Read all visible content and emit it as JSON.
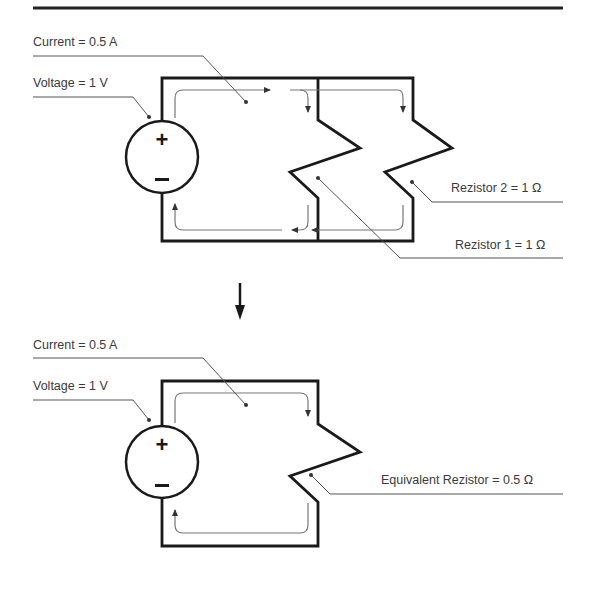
{
  "diagram": {
    "top_circuit": {
      "current_label": "Current = 0.5 A",
      "voltage_label": "Voltage = 1 V",
      "resistor2_label": "Rezistor  2 = 1 Ω",
      "resistor1_label": "Rezistor 1 = 1 Ω",
      "source_plus": "+",
      "source_minus": "–"
    },
    "bottom_circuit": {
      "current_label": "Current = 0.5 A",
      "voltage_label": "Voltage = 1 V",
      "equivalent_label": "Equivalent Rezistor = 0.5 Ω",
      "source_plus": "+",
      "source_minus": "–"
    },
    "transition_arrow": "down-arrow",
    "colors": {
      "wire": "#1a1a1a",
      "current_path": "#6a6a6a",
      "leader": "#555555",
      "text": "#3a3a3a"
    }
  }
}
